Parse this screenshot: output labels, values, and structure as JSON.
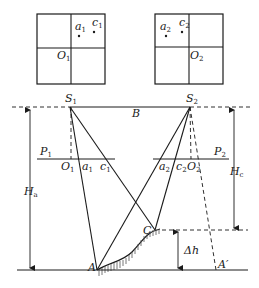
{
  "figure": {
    "photo_left": {
      "points": [
        {
          "name": "a",
          "sub": "1"
        },
        {
          "name": "c",
          "sub": "1"
        }
      ],
      "principal_point": {
        "name": "O",
        "sub": "1"
      }
    },
    "photo_right": {
      "points": [
        {
          "name": "a",
          "sub": "2"
        },
        {
          "name": "c",
          "sub": "2"
        }
      ],
      "principal_point": {
        "name": "O",
        "sub": "2"
      }
    },
    "stations": {
      "left": {
        "name": "S",
        "sub": "1"
      },
      "right": {
        "name": "S",
        "sub": "2"
      }
    },
    "baseline_label": "B",
    "image_planes": {
      "left": {
        "name": "P",
        "sub": "1",
        "points": [
          {
            "name": "O",
            "sub": "1"
          },
          {
            "name": "a",
            "sub": "1"
          },
          {
            "name": "c",
            "sub": "1"
          }
        ]
      },
      "right": {
        "name": "P",
        "sub": "2",
        "points": [
          {
            "name": "a",
            "sub": "2"
          },
          {
            "name": "c",
            "sub": "2"
          },
          {
            "name": "O",
            "sub": "2"
          }
        ]
      }
    },
    "heights": {
      "left": {
        "name": "H",
        "sub": "a"
      },
      "right": {
        "name": "H",
        "sub": "c"
      },
      "difference": "Δh"
    },
    "ground_points": {
      "A": "A",
      "C": "C",
      "A_prime": "A′"
    }
  }
}
